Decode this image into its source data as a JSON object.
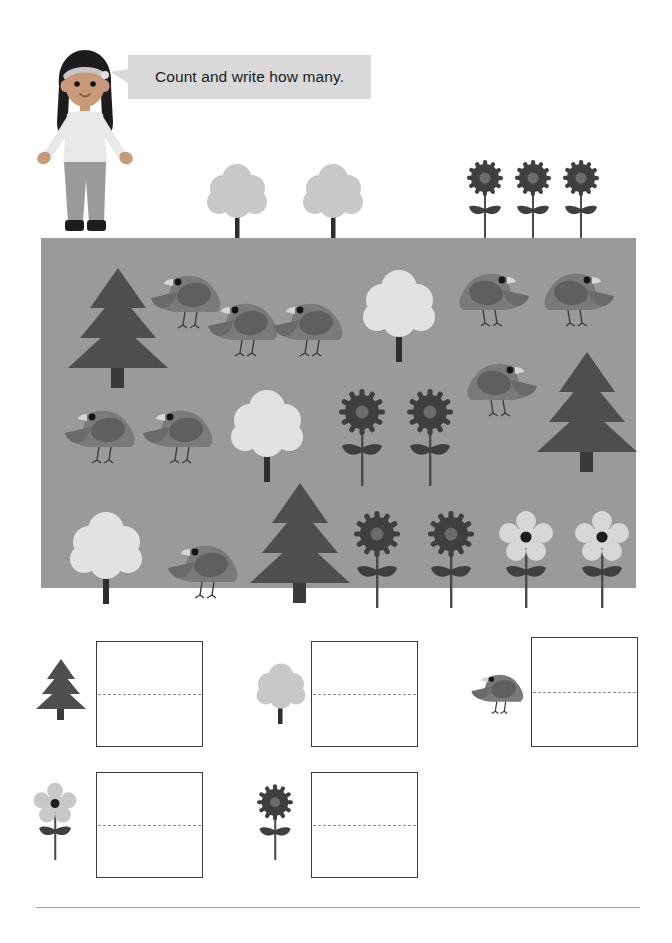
{
  "page": {
    "title": "Count and write how many.",
    "background_color": "#ffffff",
    "footer_rule_color": "#a8a8a8"
  },
  "instruction": {
    "text": "Count and write how many.",
    "bubble_color": "#d9d9d9",
    "text_color": "#1c1c1c"
  },
  "character": {
    "name": "girl-teacher",
    "hair_color": "#1d1d1f",
    "skin_color": "#c89a7a",
    "shirt_color": "#e8e8e8",
    "pants_color": "#9a9a9a",
    "shoes_color": "#1d1d1f",
    "headband_color": "#c7c7c7"
  },
  "palette": {
    "panel_bg": "#9a9a9a",
    "pine_tree": "#4e4e4e",
    "pine_trunk": "#3a3a3a",
    "round_tree_canopy_top": "#c8c8c8",
    "round_tree_canopy_scene": "#e2e2e2",
    "round_tree_trunk": "#2e2e2e",
    "bird_body": "#7a7a7a",
    "bird_wing": "#5f5f5f",
    "bird_belly": "#8e8e8e",
    "bird_eye": "#141414",
    "bird_beak": "#d6d6d6",
    "bird_leg": "#3c3c3c",
    "sunflower_petals": "#3f3f3f",
    "sunflower_center": "#6b6b6b",
    "daisy_petals": "#d7d7d7",
    "daisy_center": "#1d1d1d",
    "flower_stem": "#4a4a4a",
    "flower_leaf": "#3f3f3f",
    "box_border": "#3b3b3b",
    "box_midline": "#8c8c8c"
  },
  "top_row_props": [
    {
      "type": "round-tree",
      "x": 204,
      "y": 160
    },
    {
      "type": "round-tree",
      "x": 300,
      "y": 160
    },
    {
      "type": "sunflower",
      "x": 465,
      "y": 157
    },
    {
      "type": "sunflower",
      "x": 513,
      "y": 157
    },
    {
      "type": "sunflower",
      "x": 561,
      "y": 157
    }
  ],
  "scene": {
    "panel": {
      "x": 41,
      "y": 238,
      "width": 595,
      "height": 350
    },
    "items": [
      {
        "type": "pine-tree",
        "x": 25,
        "y": 28,
        "scale": 1.0
      },
      {
        "type": "bird-left",
        "x": 108,
        "y": 30,
        "scale": 1.0
      },
      {
        "type": "bird-left",
        "x": 165,
        "y": 58,
        "scale": 0.95
      },
      {
        "type": "bird-left",
        "x": 230,
        "y": 58,
        "scale": 0.95
      },
      {
        "type": "round-tree",
        "x": 318,
        "y": 28,
        "scale": 1.0
      },
      {
        "type": "bird-right",
        "x": 412,
        "y": 28,
        "scale": 1.0
      },
      {
        "type": "bird-right",
        "x": 497,
        "y": 28,
        "scale": 1.0
      },
      {
        "type": "bird-right",
        "x": 420,
        "y": 118,
        "scale": 1.0
      },
      {
        "type": "pine-tree",
        "x": 494,
        "y": 112,
        "scale": 1.0
      },
      {
        "type": "bird-left",
        "x": 22,
        "y": 165,
        "scale": 0.95
      },
      {
        "type": "bird-left",
        "x": 100,
        "y": 165,
        "scale": 0.95
      },
      {
        "type": "round-tree",
        "x": 186,
        "y": 148,
        "scale": 1.0
      },
      {
        "type": "sunflower",
        "x": 296,
        "y": 148,
        "scale": 1.0
      },
      {
        "type": "sunflower",
        "x": 364,
        "y": 148,
        "scale": 1.0
      },
      {
        "type": "round-tree",
        "x": 25,
        "y": 270,
        "scale": 1.0
      },
      {
        "type": "bird-left",
        "x": 125,
        "y": 300,
        "scale": 0.95
      },
      {
        "type": "pine-tree",
        "x": 207,
        "y": 243,
        "scale": 1.0
      },
      {
        "type": "sunflower",
        "x": 311,
        "y": 270,
        "scale": 1.0
      },
      {
        "type": "sunflower",
        "x": 385,
        "y": 270,
        "scale": 1.0
      },
      {
        "type": "daisy",
        "x": 458,
        "y": 272,
        "scale": 1.0
      },
      {
        "type": "daisy",
        "x": 534,
        "y": 272,
        "scale": 1.0
      }
    ]
  },
  "answers": [
    {
      "id": "pine-tree",
      "icon": "pine-tree-icon",
      "icon_x": 35,
      "icon_y": 658,
      "box_x": 96,
      "box_y": 641,
      "box_w": 107,
      "box_h": 106,
      "value": "",
      "placeholder": ""
    },
    {
      "id": "round-tree",
      "icon": "round-tree-icon",
      "icon_x": 253,
      "icon_y": 662,
      "box_x": 311,
      "box_y": 641,
      "box_w": 107,
      "box_h": 106,
      "value": "",
      "placeholder": ""
    },
    {
      "id": "bird",
      "icon": "bird-icon",
      "icon_x": 470,
      "icon_y": 668,
      "box_x": 531,
      "box_y": 637,
      "box_w": 107,
      "box_h": 110,
      "value": "",
      "placeholder": ""
    },
    {
      "id": "daisy",
      "icon": "daisy-icon",
      "icon_x": 33,
      "icon_y": 782,
      "box_x": 96,
      "box_y": 772,
      "box_w": 107,
      "box_h": 106,
      "value": "",
      "placeholder": ""
    },
    {
      "id": "sunflower",
      "icon": "sunflower-icon",
      "icon_x": 253,
      "icon_y": 782,
      "box_x": 311,
      "box_y": 772,
      "box_w": 107,
      "box_h": 106,
      "value": "",
      "placeholder": ""
    }
  ],
  "counts": {
    "pine_tree_in_scene": 3,
    "round_tree_in_scene": 3,
    "bird_in_scene": 9,
    "sunflower_in_scene": 4,
    "daisy_in_scene": 2
  }
}
